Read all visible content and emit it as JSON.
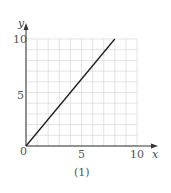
{
  "chart_data": {
    "type": "line",
    "title": "",
    "caption": "(1)",
    "xlabel": "x",
    "ylabel": "y",
    "xlim": [
      0,
      10
    ],
    "ylim": [
      0,
      10
    ],
    "x_ticks": [
      "5",
      "10"
    ],
    "y_ticks": [
      "5",
      "10"
    ],
    "origin_label": "0",
    "grid": true,
    "grid_step": 1,
    "series": [
      {
        "name": "line",
        "x": [
          0,
          8
        ],
        "y": [
          0,
          10
        ]
      }
    ]
  },
  "colors": {
    "grid": "#d8d8d8",
    "axis": "#333333",
    "line": "#222222"
  }
}
